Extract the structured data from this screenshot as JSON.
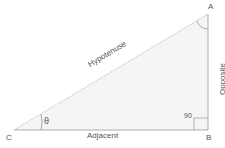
{
  "diagram": {
    "vertices": {
      "A": "A",
      "B": "B",
      "C": "C"
    },
    "sides": {
      "hypotenuse": "Hypotenuse",
      "opposite": "Opposite",
      "adjacent": "Adjacent"
    },
    "angles": {
      "theta": "θ",
      "right": "90"
    },
    "colors": {
      "fill": "#f4f4f4",
      "stroke": "#aaaaaa",
      "text": "#555555"
    }
  }
}
